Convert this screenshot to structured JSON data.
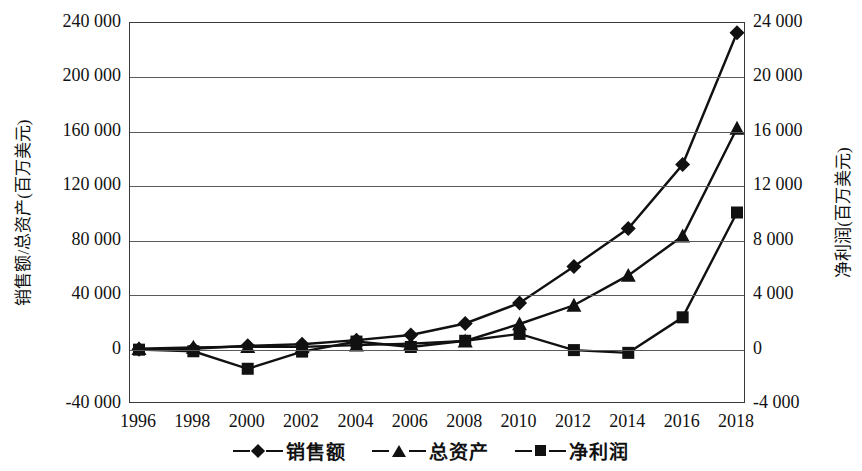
{
  "chart_data": {
    "type": "line",
    "title": "",
    "xlabel": "",
    "categories": [
      1996,
      1998,
      2000,
      2002,
      2004,
      2006,
      2008,
      2010,
      2012,
      2014,
      2016,
      2018
    ],
    "x_tick_labels": [
      "1996",
      "1998",
      "2000",
      "2002",
      "2004",
      "2006",
      "2008",
      "2010",
      "2012",
      "2014",
      "2016",
      "2018"
    ],
    "grid": true,
    "legend_position": "bottom",
    "axes": {
      "left": {
        "label": "销售额/总资产(百万美元)",
        "ylim": [
          -40000,
          240000
        ],
        "tick_step": 40000,
        "tick_labels": [
          "240 000",
          "200 000",
          "160 000",
          "120 000",
          "80 000",
          "40 000",
          "0",
          "-40 000"
        ],
        "tick_values": [
          240000,
          200000,
          160000,
          120000,
          80000,
          40000,
          0,
          -40000
        ]
      },
      "right": {
        "label": "净利润(百万美元)",
        "ylim": [
          -4000,
          24000
        ],
        "tick_step": 4000,
        "tick_labels": [
          "24 000",
          "20 000",
          "16 000",
          "12 000",
          "8 000",
          "4 000",
          "0",
          "-4 000"
        ],
        "tick_values": [
          24000,
          20000,
          16000,
          12000,
          8000,
          4000,
          0,
          -4000
        ]
      }
    },
    "series": [
      {
        "name": "销售额",
        "marker": "diamond",
        "axis": "left",
        "color": "#111111",
        "values": [
          148,
          610,
          2762,
          3933,
          6921,
          10711,
          19166,
          34204,
          61093,
          88988,
          135987,
          232887
        ]
      },
      {
        "name": "总资产",
        "marker": "triangle",
        "axis": "left",
        "color": "#111111",
        "values": [
          648,
          1639,
          2135,
          1990,
          3249,
          4363,
          6298,
          18797,
          32555,
          54505,
          83402,
          162648
        ]
      },
      {
        "name": "净利润",
        "marker": "square",
        "axis": "right",
        "color": "#111111",
        "values": [
          -6,
          -125,
          -1411,
          -149,
          588,
          190,
          645,
          1152,
          -39,
          -241,
          2371,
          10073
        ]
      }
    ]
  },
  "legend": {
    "items": [
      {
        "label": "销售额",
        "marker": "diamond"
      },
      {
        "label": "总资产",
        "marker": "triangle"
      },
      {
        "label": "净利润",
        "marker": "square"
      }
    ]
  }
}
